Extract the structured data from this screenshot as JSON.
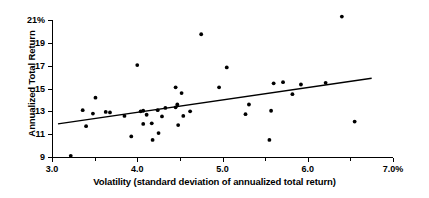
{
  "chart_data": {
    "type": "scatter",
    "title": "",
    "xlabel": "Volatility (standard deviation of annualized total return)",
    "ylabel": "Annualized Total Return",
    "xlim": [
      3.0,
      7.0
    ],
    "ylim": [
      9,
      21
    ],
    "grid": false,
    "legend": "none",
    "x_tick_labels": [
      "3.0",
      "4.0",
      "5.0",
      "6.0",
      "7.0%"
    ],
    "x_tick_values": [
      3.0,
      4.0,
      5.0,
      6.0,
      7.0
    ],
    "x_minor_tick_values": [
      3.5,
      4.5,
      5.5,
      6.5
    ],
    "y_tick_labels": [
      "9",
      "11",
      "13",
      "15",
      "17",
      "19",
      "21%"
    ],
    "y_tick_values": [
      9,
      11,
      13,
      15,
      17,
      19,
      21
    ],
    "points": [
      {
        "x": 3.22,
        "y": 9.1
      },
      {
        "x": 3.36,
        "y": 13.1
      },
      {
        "x": 3.4,
        "y": 11.7
      },
      {
        "x": 3.48,
        "y": 12.8
      },
      {
        "x": 3.51,
        "y": 14.2
      },
      {
        "x": 3.63,
        "y": 12.95
      },
      {
        "x": 3.68,
        "y": 12.9
      },
      {
        "x": 3.85,
        "y": 12.6
      },
      {
        "x": 3.93,
        "y": 10.8
      },
      {
        "x": 4.0,
        "y": 17.05
      },
      {
        "x": 4.04,
        "y": 13.0
      },
      {
        "x": 4.07,
        "y": 13.05
      },
      {
        "x": 4.07,
        "y": 11.9
      },
      {
        "x": 4.11,
        "y": 12.7
      },
      {
        "x": 4.17,
        "y": 11.95
      },
      {
        "x": 4.18,
        "y": 10.5
      },
      {
        "x": 4.24,
        "y": 13.1
      },
      {
        "x": 4.25,
        "y": 11.1
      },
      {
        "x": 4.29,
        "y": 12.55
      },
      {
        "x": 4.33,
        "y": 13.3
      },
      {
        "x": 4.45,
        "y": 15.1
      },
      {
        "x": 4.45,
        "y": 13.35
      },
      {
        "x": 4.47,
        "y": 13.6
      },
      {
        "x": 4.48,
        "y": 11.8
      },
      {
        "x": 4.52,
        "y": 14.6
      },
      {
        "x": 4.54,
        "y": 12.6
      },
      {
        "x": 4.62,
        "y": 13.0
      },
      {
        "x": 4.75,
        "y": 19.75
      },
      {
        "x": 4.96,
        "y": 15.1
      },
      {
        "x": 5.05,
        "y": 16.85
      },
      {
        "x": 5.27,
        "y": 12.75
      },
      {
        "x": 5.31,
        "y": 13.6
      },
      {
        "x": 5.55,
        "y": 10.5
      },
      {
        "x": 5.57,
        "y": 13.05
      },
      {
        "x": 5.6,
        "y": 15.45
      },
      {
        "x": 5.71,
        "y": 15.55
      },
      {
        "x": 5.82,
        "y": 14.5
      },
      {
        "x": 5.92,
        "y": 15.35
      },
      {
        "x": 6.21,
        "y": 15.5
      },
      {
        "x": 6.4,
        "y": 21.3
      },
      {
        "x": 6.55,
        "y": 12.1
      }
    ],
    "trend_line": {
      "x_start": 3.07,
      "y_start": 11.9,
      "x_end": 6.75,
      "y_end": 15.9
    }
  }
}
